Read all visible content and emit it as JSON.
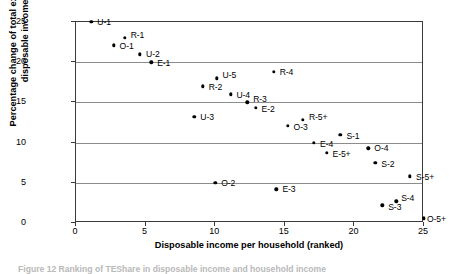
{
  "chart_data": {
    "type": "scatter",
    "title": "",
    "xlabel": "Disposable income per household (ranked)",
    "ylabel": "Percentage change of total expenditure share in disposable income (ranked)",
    "xlim": [
      0,
      25
    ],
    "ylim": [
      0,
      25
    ],
    "xticks": [
      0,
      5,
      10,
      15,
      20,
      25
    ],
    "yticks": [
      0,
      5,
      10,
      15,
      20,
      25
    ],
    "grid": "horizontal",
    "legend": "none",
    "points": [
      {
        "label": "U-1",
        "x": 1.1,
        "y": 25.0,
        "label_dx": 6,
        "label_dy": -4
      },
      {
        "label": "O-1",
        "x": 2.7,
        "y": 22.1,
        "label_dx": 6,
        "label_dy": -3
      },
      {
        "label": "R-1",
        "x": 3.5,
        "y": 23.0,
        "label_dx": 6,
        "label_dy": -7
      },
      {
        "label": "U-2",
        "x": 4.6,
        "y": 21.0,
        "label_dx": 6,
        "label_dy": -4
      },
      {
        "label": "E-1",
        "x": 5.4,
        "y": 20.0,
        "label_dx": 6,
        "label_dy": -3
      },
      {
        "label": "U-3",
        "x": 8.5,
        "y": 13.2,
        "label_dx": 6,
        "label_dy": -4
      },
      {
        "label": "R-2",
        "x": 9.1,
        "y": 17.0,
        "label_dx": 6,
        "label_dy": -3
      },
      {
        "label": "U-5",
        "x": 10.1,
        "y": 18.0,
        "label_dx": 6,
        "label_dy": -7
      },
      {
        "label": "O-2",
        "x": 10.0,
        "y": 5.0,
        "label_dx": 6,
        "label_dy": -4
      },
      {
        "label": "U-4",
        "x": 11.1,
        "y": 16.0,
        "label_dx": 6,
        "label_dy": -3
      },
      {
        "label": "R-3",
        "x": 12.3,
        "y": 15.0,
        "label_dx": 6,
        "label_dy": -7
      },
      {
        "label": "E-2",
        "x": 12.9,
        "y": 14.3,
        "label_dx": 6,
        "label_dy": -3
      },
      {
        "label": "R-4",
        "x": 14.2,
        "y": 18.8,
        "label_dx": 6,
        "label_dy": -4
      },
      {
        "label": "E-3",
        "x": 14.4,
        "y": 4.2,
        "label_dx": 6,
        "label_dy": -4
      },
      {
        "label": "O-3",
        "x": 15.2,
        "y": 12.1,
        "label_dx": 6,
        "label_dy": -3
      },
      {
        "label": "R-5+",
        "x": 16.3,
        "y": 12.8,
        "label_dx": 6,
        "label_dy": -7
      },
      {
        "label": "E-4",
        "x": 17.1,
        "y": 10.0,
        "label_dx": 6,
        "label_dy": -3
      },
      {
        "label": "E-5+",
        "x": 18.0,
        "y": 8.7,
        "label_dx": 6,
        "label_dy": -3
      },
      {
        "label": "S-1",
        "x": 19.0,
        "y": 11.0,
        "label_dx": 6,
        "label_dy": -3
      },
      {
        "label": "O-4",
        "x": 21.0,
        "y": 9.3,
        "label_dx": 6,
        "label_dy": -4
      },
      {
        "label": "S-2",
        "x": 21.5,
        "y": 7.5,
        "label_dx": 6,
        "label_dy": -3
      },
      {
        "label": "S-3",
        "x": 22.0,
        "y": 2.2,
        "label_dx": 6,
        "label_dy": -2
      },
      {
        "label": "S-4",
        "x": 23.0,
        "y": 2.7,
        "label_dx": 5,
        "label_dy": -7
      },
      {
        "label": "S-5+",
        "x": 24.0,
        "y": 5.8,
        "label_dx": 6,
        "label_dy": -3
      },
      {
        "label": "O-5+",
        "x": 25.0,
        "y": 0.6,
        "label_dx": 3,
        "label_dy": -3
      }
    ]
  },
  "axes": {
    "y_title": "Percentage change of total expenditure share in disposable income (ranked)",
    "x_title": "Disposable income per household (ranked)",
    "x_tick_labels": [
      "0",
      "5",
      "10",
      "15",
      "20",
      "25"
    ],
    "y_tick_labels": [
      "0",
      "5",
      "10",
      "15",
      "20",
      "25"
    ]
  },
  "caption": {
    "text": "Figure 12 Ranking of TEShare in disposable income and household income"
  },
  "colors": {
    "marker": "#000000",
    "gridline": "#8c8c8c",
    "axis": "#3a3a3a",
    "background": "#ffffff"
  }
}
